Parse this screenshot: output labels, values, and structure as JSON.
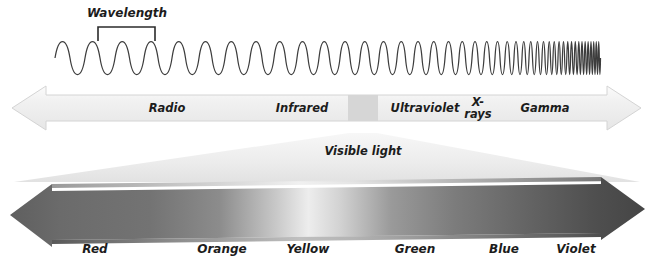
{
  "figure": {
    "background_color": "#ffffff",
    "ink_color": "#1c1c1c"
  },
  "wavelength_annotation": {
    "label": "Wavelength",
    "bracket_name": "wavelength-bracket"
  },
  "wave": {
    "name": "electromagnetic-wave",
    "stroke_color": "#3a3a3a",
    "description": "sine wave whose frequency increases from left to right"
  },
  "spectrum_arrow": {
    "name": "spectrum-arrow",
    "fill_color": "#f0f0f0",
    "edge_color": "#d8d8d8",
    "direction": "bidirectional",
    "bands": [
      {
        "label": "Radio",
        "center_x": 167
      },
      {
        "label": "Infrared",
        "center_x": 302
      },
      {
        "label": "Ultraviolet",
        "center_x": 425
      },
      {
        "label": "X-",
        "label2": "rays",
        "center_x": 478
      },
      {
        "label": "Gamma",
        "center_x": 545
      }
    ],
    "visible_band": {
      "name": "visible-light-band",
      "fill_color": "#d6d6d6",
      "start_x": 348,
      "end_x": 378
    }
  },
  "funnel": {
    "name": "visible-light-funnel",
    "label": "Visible light",
    "fill_color": "#eaeaea"
  },
  "color_arrow": {
    "name": "visible-color-arrow",
    "direction": "bidirectional",
    "gradient": "dark gray at left (Red) through light gray (Yellow) to dark gray at right (Violet)",
    "colors": [
      {
        "label": "Red",
        "center_x": 95,
        "tone": "#6e6e6e"
      },
      {
        "label": "Orange",
        "center_x": 222,
        "tone": "#909090"
      },
      {
        "label": "Yellow",
        "center_x": 308,
        "tone": "#e8e8e8"
      },
      {
        "label": "Green",
        "center_x": 415,
        "tone": "#8a8a8a"
      },
      {
        "label": "Blue",
        "center_x": 504,
        "tone": "#5c5c5c"
      },
      {
        "label": "Violet",
        "center_x": 576,
        "tone": "#4a4a4a"
      }
    ]
  }
}
